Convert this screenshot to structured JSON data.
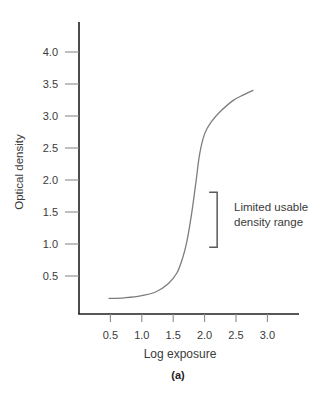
{
  "caption": "(a)",
  "annotation": {
    "line1": "Limited usable",
    "line2": "density range"
  },
  "chart_data": {
    "type": "line",
    "title": "",
    "xlabel": "Log exposure",
    "ylabel": "Optical density",
    "xlim": [
      0,
      3.5
    ],
    "ylim": [
      0,
      4.5
    ],
    "grid": false,
    "x_ticks": [
      0.5,
      1.0,
      1.5,
      2.0,
      2.5,
      3.0
    ],
    "y_ticks": [
      0.5,
      1.0,
      1.5,
      2.0,
      2.5,
      3.0,
      3.5,
      4.0
    ],
    "series": [
      {
        "name": "characteristic-curve",
        "points": [
          [
            0.48,
            0.15
          ],
          [
            0.72,
            0.16
          ],
          [
            0.98,
            0.19
          ],
          [
            1.22,
            0.25
          ],
          [
            1.42,
            0.38
          ],
          [
            1.56,
            0.55
          ],
          [
            1.65,
            0.78
          ],
          [
            1.72,
            1.05
          ],
          [
            1.79,
            1.45
          ],
          [
            1.86,
            1.95
          ],
          [
            1.92,
            2.4
          ],
          [
            2.0,
            2.72
          ],
          [
            2.1,
            2.9
          ],
          [
            2.25,
            3.07
          ],
          [
            2.45,
            3.24
          ],
          [
            2.62,
            3.33
          ],
          [
            2.77,
            3.4
          ]
        ]
      }
    ],
    "bracket": {
      "x": 2.2,
      "density_from": 0.95,
      "density_to": 1.81,
      "label": "Limited usable density range"
    },
    "colors": {
      "axis": "#1f1f1f",
      "tick": "#8a8a8a",
      "curve": "#7d7d7d",
      "bracket": "#5a5a5a",
      "text": "#3a3a3a"
    }
  }
}
